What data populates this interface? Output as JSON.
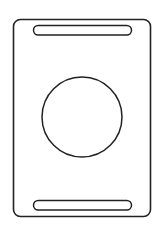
{
  "canvas": {
    "width": 165,
    "height": 228,
    "background": "#ffffff"
  },
  "style": {
    "stroke_color": "#222222",
    "fill_color": "#ffffff"
  },
  "shapes": {
    "card_outline": {
      "x": 13.5,
      "y": 19.5,
      "width": 137,
      "height": 197,
      "rx": 7,
      "stroke_width": 1.6
    },
    "top_slot": {
      "x": 33.5,
      "y": 25.5,
      "width": 98,
      "height": 9.5,
      "rx": 4.75,
      "stroke_width": 1.5
    },
    "bottom_slot": {
      "x": 33.5,
      "y": 200.5,
      "width": 98,
      "height": 9.5,
      "rx": 4.75,
      "stroke_width": 1.5
    },
    "center_circle": {
      "cx": 82,
      "cy": 117,
      "r": 40,
      "stroke_width": 1.5
    }
  }
}
